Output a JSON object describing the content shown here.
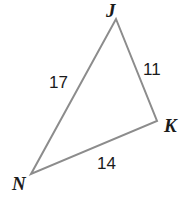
{
  "figure": {
    "type": "triangle-diagram",
    "background_color": "#ffffff",
    "stroke_color": "#8c8c8c",
    "stroke_width": 2,
    "text_color": "#1b1b1b",
    "vertices": [
      {
        "name": "J",
        "label": "J",
        "x": 116,
        "y": 19
      },
      {
        "name": "K",
        "label": "K",
        "x": 157,
        "y": 121
      },
      {
        "name": "N",
        "label": "N",
        "x": 31,
        "y": 174
      }
    ],
    "sides": [
      {
        "name": "JN",
        "label": "17",
        "from": "J",
        "to": "N",
        "length": 17
      },
      {
        "name": "JK",
        "label": "11",
        "from": "J",
        "to": "K",
        "length": 11
      },
      {
        "name": "NK",
        "label": "14",
        "from": "N",
        "to": "K",
        "length": 14
      }
    ]
  },
  "chart_data": {
    "type": "diagram",
    "title": "",
    "shape": "triangle",
    "vertex_labels": [
      "J",
      "K",
      "N"
    ],
    "side_labels": [
      "17",
      "11",
      "14"
    ],
    "edges": [
      {
        "endpoints": [
          "J",
          "N"
        ],
        "value": 17
      },
      {
        "endpoints": [
          "J",
          "K"
        ],
        "value": 11
      },
      {
        "endpoints": [
          "N",
          "K"
        ],
        "value": 14
      }
    ]
  }
}
